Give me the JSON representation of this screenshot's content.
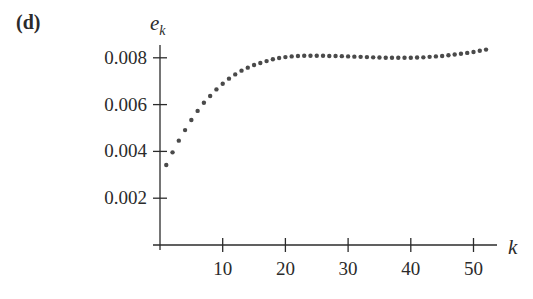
{
  "panel_label": "(d)",
  "chart_data": {
    "type": "scatter",
    "title": "",
    "xlabel": "k",
    "ylabel": "e_k",
    "ylabel_base": "e",
    "ylabel_sub": "k",
    "xlim": [
      0,
      54
    ],
    "ylim": [
      0,
      0.008
    ],
    "grid": false,
    "legend": null,
    "x_ticks": [
      10,
      20,
      30,
      40,
      50
    ],
    "x_tick_labels": [
      "10",
      "20",
      "30",
      "40",
      "50"
    ],
    "y_ticks": [
      0.002,
      0.004,
      0.006,
      0.008
    ],
    "y_tick_labels": [
      "0.002",
      "0.004",
      "0.006",
      "0.008"
    ],
    "marker_color": "#4a4a4a",
    "x": [
      1,
      2,
      3,
      4,
      5,
      6,
      7,
      8,
      9,
      10,
      11,
      12,
      13,
      14,
      15,
      16,
      17,
      18,
      19,
      20,
      21,
      22,
      23,
      24,
      25,
      26,
      27,
      28,
      29,
      30,
      31,
      32,
      33,
      34,
      35,
      36,
      37,
      38,
      39,
      40,
      41,
      42,
      43,
      44,
      45,
      46,
      47,
      48,
      49,
      50,
      51,
      52
    ],
    "y": [
      0.00342,
      0.00396,
      0.00446,
      0.00491,
      0.00534,
      0.00573,
      0.00608,
      0.00637,
      0.00665,
      0.00689,
      0.00711,
      0.00729,
      0.00745,
      0.00758,
      0.00769,
      0.00778,
      0.00786,
      0.00794,
      0.00799,
      0.00803,
      0.00806,
      0.00808,
      0.00809,
      0.00809,
      0.00809,
      0.00809,
      0.00808,
      0.00808,
      0.00807,
      0.00806,
      0.00805,
      0.00804,
      0.00803,
      0.00802,
      0.00801,
      0.008,
      0.008,
      0.008,
      0.008,
      0.008,
      0.00801,
      0.00802,
      0.00804,
      0.00806,
      0.00808,
      0.00811,
      0.00814,
      0.00817,
      0.00821,
      0.00825,
      0.0083,
      0.00835
    ]
  }
}
